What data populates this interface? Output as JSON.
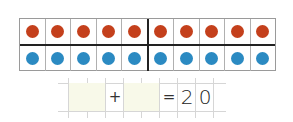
{
  "ten_frame": {
    "columns": 10,
    "rows": [
      {
        "color": "red",
        "fill": "#c4401c",
        "count": 10
      },
      {
        "color": "blue",
        "fill": "#2b8ac2",
        "count": 10
      }
    ]
  },
  "equation": {
    "addend1": "",
    "plus": "+",
    "addend2": "",
    "equals": "=",
    "sum_digits": [
      "2",
      "0"
    ],
    "answer_box_color": "#f8f9e9"
  }
}
